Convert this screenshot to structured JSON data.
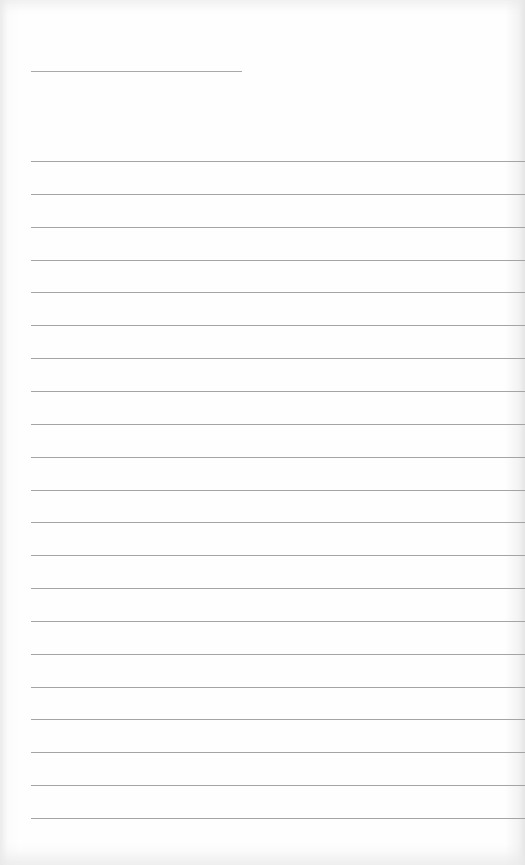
{
  "page": {
    "type": "lined-notepad-sheet",
    "title_line": {
      "text": ""
    },
    "ruled_lines": [
      {
        "text": ""
      },
      {
        "text": ""
      },
      {
        "text": ""
      },
      {
        "text": ""
      },
      {
        "text": ""
      },
      {
        "text": ""
      },
      {
        "text": ""
      },
      {
        "text": ""
      },
      {
        "text": ""
      },
      {
        "text": ""
      },
      {
        "text": ""
      },
      {
        "text": ""
      },
      {
        "text": ""
      },
      {
        "text": ""
      },
      {
        "text": ""
      },
      {
        "text": ""
      },
      {
        "text": ""
      },
      {
        "text": ""
      },
      {
        "text": ""
      },
      {
        "text": ""
      },
      {
        "text": ""
      }
    ]
  }
}
